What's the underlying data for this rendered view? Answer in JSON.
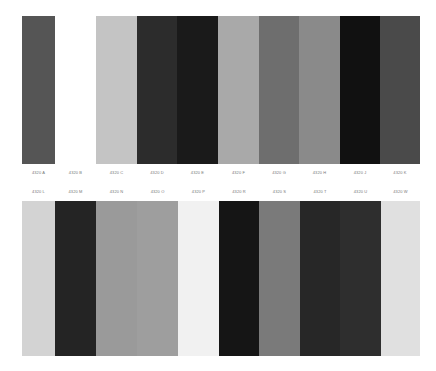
{
  "top_row": {
    "swatches": [
      {
        "label": "4320 A",
        "color": "#555555",
        "width": 33
      },
      {
        "label": "4320 B",
        "color": "#ffffff",
        "width": 41
      },
      {
        "label": "4320 C",
        "color": "#c4c4c4",
        "width": 41
      },
      {
        "label": "4320 D",
        "color": "#2c2c2c",
        "width": 40
      },
      {
        "label": "4320 E",
        "color": "#1a1a1a",
        "width": 41
      },
      {
        "label": "4320 F",
        "color": "#a9a9a9",
        "width": 41
      },
      {
        "label": "4320 G",
        "color": "#6e6e6e",
        "width": 40
      },
      {
        "label": "4320 H",
        "color": "#8a8a8a",
        "width": 41
      },
      {
        "label": "4320 J",
        "color": "#111111",
        "width": 40
      },
      {
        "label": "4320 K",
        "color": "#4a4a4a",
        "width": 40
      }
    ]
  },
  "bottom_row": {
    "swatches": [
      {
        "label": "4320 L",
        "color": "#d3d3d3",
        "width": 33
      },
      {
        "label": "4320 M",
        "color": "#242424",
        "width": 41
      },
      {
        "label": "4320 N",
        "color": "#9a9a9a",
        "width": 41
      },
      {
        "label": "4320 O",
        "color": "#9e9e9e",
        "width": 41
      },
      {
        "label": "4320 P",
        "color": "#f1f1f1",
        "width": 41
      },
      {
        "label": "4320 R",
        "color": "#151515",
        "width": 40
      },
      {
        "label": "4320 S",
        "color": "#7a7a7a",
        "width": 41
      },
      {
        "label": "4320 T",
        "color": "#272727",
        "width": 40
      },
      {
        "label": "4320 U",
        "color": "#2e2e2e",
        "width": 41
      },
      {
        "label": "4320 W",
        "color": "#e0e0e0",
        "width": 39
      }
    ]
  }
}
